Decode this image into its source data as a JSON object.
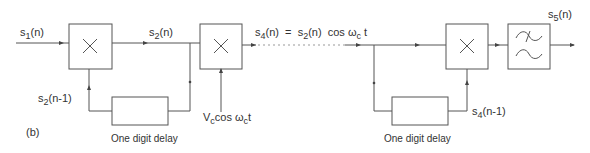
{
  "figure_label": "(b)",
  "colors": {
    "line": "#555555",
    "text": "#333333",
    "background": "#ffffff"
  },
  "blocks": [
    {
      "id": "mult-1",
      "type": "multiplier",
      "symbol": "×"
    },
    {
      "id": "mult-2",
      "type": "multiplier",
      "symbol": "×"
    },
    {
      "id": "mult-3",
      "type": "multiplier",
      "symbol": "×"
    },
    {
      "id": "lpf",
      "type": "low-pass-filter",
      "symbol": "filter"
    },
    {
      "id": "delay-1",
      "type": "delay",
      "caption": "One digit delay"
    },
    {
      "id": "delay-2",
      "type": "delay",
      "caption": "One digit delay"
    }
  ],
  "signals": {
    "s1": {
      "base": "s",
      "sub": "1",
      "rest": "(n)"
    },
    "s2": {
      "base": "s",
      "sub": "2",
      "rest": "(n)"
    },
    "s2_delayed": {
      "base": "s",
      "sub": "2",
      "rest": "(n-1)"
    },
    "carrier": {
      "base": "V",
      "sub": "c",
      "mid": "cos ω",
      "sub2": "c",
      "rest": "t"
    },
    "s4_eq": {
      "lhs_base": "s",
      "lhs_sub": "4",
      "lhs_rest": "(n)",
      "eq": "=",
      "rhs_base": "s",
      "rhs_sub": "2",
      "rhs_rest": "(n)",
      "cos": "cos ω",
      "cos_sub": "c",
      "cos_rest": "t"
    },
    "s4_delayed": {
      "base": "s",
      "sub": "4",
      "rest": "(n-1)"
    },
    "s5": {
      "base": "s",
      "sub": "5",
      "rest": "(n)"
    }
  },
  "captions": {
    "delay_1": "One digit delay",
    "delay_2": "One digit delay"
  }
}
